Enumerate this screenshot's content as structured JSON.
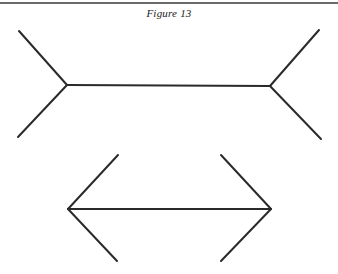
{
  "caption": "Figure 13",
  "colors": {
    "line": "#2a2a2a",
    "rule": "#6b6b6b",
    "background": "#ffffff"
  },
  "figures": {
    "top": {
      "description": "Muller-Lyer figure with fins pointing outward",
      "shaft": {
        "x1": 67,
        "y1": 85,
        "x2": 270,
        "y2": 86
      },
      "fins": [
        {
          "x1": 19,
          "y1": 31,
          "x2": 67,
          "y2": 85
        },
        {
          "x1": 18,
          "y1": 137,
          "x2": 67,
          "y2": 85
        },
        {
          "x1": 319,
          "y1": 30,
          "x2": 270,
          "y2": 86
        },
        {
          "x1": 321,
          "y1": 139,
          "x2": 270,
          "y2": 86
        }
      ]
    },
    "bottom": {
      "description": "Muller-Lyer figure with arrowheads pointing outward",
      "shaft": {
        "x1": 68,
        "y1": 209,
        "x2": 271,
        "y2": 209
      },
      "fins": [
        {
          "x1": 118,
          "y1": 155,
          "x2": 68,
          "y2": 209
        },
        {
          "x1": 117,
          "y1": 261,
          "x2": 68,
          "y2": 209
        },
        {
          "x1": 221,
          "y1": 155,
          "x2": 271,
          "y2": 209
        },
        {
          "x1": 221,
          "y1": 261,
          "x2": 271,
          "y2": 209
        }
      ]
    }
  }
}
